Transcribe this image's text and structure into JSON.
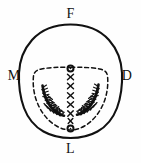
{
  "figure": {
    "type": "anatomical-line-diagram",
    "width": 141,
    "height": 163,
    "background_color": "#fefefe",
    "ink_color": "#111111"
  },
  "labels": {
    "top": "F",
    "left": "M",
    "right": "D",
    "bottom": "L"
  },
  "outline": {
    "name": "outer-contour",
    "style": "solid",
    "stroke_color": "#111111",
    "stroke_width": 2.1,
    "description": "closed egg-shaped outline, broad rounded dome at top, narrower flattened base at bottom"
  },
  "inner_boundary": {
    "name": "inner-dashed-contour",
    "style": "dashed",
    "stroke_color": "#111111",
    "stroke_width": 1.5,
    "dash_pattern": "4 3",
    "description": "closed dashed outline nested inside the solid contour, flat-topped with rounded lower half"
  },
  "midline_markers": {
    "description": "vertical column of markers along the figure midline from F toward L",
    "items": [
      {
        "symbol": "o",
        "kind": "circle-marker",
        "x": 70.5,
        "y": 68.5
      },
      {
        "symbol": "x",
        "kind": "cross-marker",
        "x": 70.5,
        "y": 77.0
      },
      {
        "symbol": "x",
        "kind": "cross-marker",
        "x": 70.5,
        "y": 86.0
      },
      {
        "symbol": "x",
        "kind": "cross-marker",
        "x": 70.5,
        "y": 95.5
      },
      {
        "symbol": "x",
        "kind": "cross-marker",
        "x": 70.5,
        "y": 104.5
      },
      {
        "symbol": "x",
        "kind": "cross-marker",
        "x": 70.5,
        "y": 113.5
      },
      {
        "symbol": "x",
        "kind": "cross-marker",
        "x": 70.5,
        "y": 121.0
      },
      {
        "symbol": "o",
        "kind": "circle-marker",
        "x": 70.5,
        "y": 128.5
      }
    ],
    "circle_count": 2,
    "cross_count": 6
  },
  "hatch_clusters": [
    {
      "name": "left-cluster",
      "side": "mesial",
      "description": "dense crescent-shaped stipple and hatch cluster curving down-and-inward",
      "center_x": 52,
      "center_y": 102
    },
    {
      "name": "right-cluster",
      "side": "distal",
      "description": "dense crescent-shaped stipple and hatch cluster curving down-and-inward",
      "center_x": 89,
      "center_y": 100
    }
  ]
}
